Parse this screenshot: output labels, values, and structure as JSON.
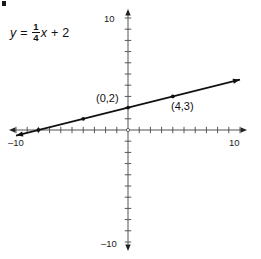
{
  "figure": {
    "equation": {
      "lhs": "y",
      "equals": "=",
      "numerator": "1",
      "denominator": "4",
      "variable": "x",
      "plus": "+",
      "constant": "2",
      "full_text": "y = 1/4 x + 2"
    },
    "axis_labels": {
      "y_top": "10",
      "y_bottom": "–10",
      "x_left": "–10",
      "x_right": "10"
    },
    "point_labels": [
      {
        "text": "(0,2)"
      },
      {
        "text": "(4,3)"
      }
    ],
    "colors": {
      "line": "#111111",
      "axis": "#555555",
      "text": "#111111",
      "background": "#ffffff"
    }
  },
  "chart_data": {
    "type": "line",
    "title": "",
    "xlabel": "",
    "ylabel": "",
    "xlim": [
      -10,
      10
    ],
    "ylim": [
      -10,
      10
    ],
    "grid": false,
    "legend": "none",
    "x_ticks": [
      -10,
      -9,
      -8,
      -7,
      -6,
      -5,
      -4,
      -3,
      -2,
      -1,
      0,
      1,
      2,
      3,
      4,
      5,
      6,
      7,
      8,
      9,
      10
    ],
    "y_ticks": [
      -10,
      -9,
      -8,
      -7,
      -6,
      -5,
      -4,
      -3,
      -2,
      -1,
      0,
      1,
      2,
      3,
      4,
      5,
      6,
      7,
      8,
      9,
      10
    ],
    "x_tick_labels_shown": [
      "-10",
      "10"
    ],
    "y_tick_labels_shown": [
      "10",
      "-10"
    ],
    "series": [
      {
        "name": "y = 1/4 x + 2",
        "equation": "y = 0.25x + 2",
        "slope": 0.25,
        "intercept": 2,
        "x": [
          -10,
          10
        ],
        "values": [
          -0.5,
          4.5
        ],
        "arrows": [
          "start",
          "end"
        ]
      }
    ],
    "marked_points": [
      {
        "x": -4,
        "y": 1,
        "label": ""
      },
      {
        "x": -8,
        "y": 0,
        "label": ""
      },
      {
        "x": 0,
        "y": 2,
        "label": "(0,2)"
      },
      {
        "x": 4,
        "y": 3,
        "label": "(4,3)"
      }
    ]
  }
}
